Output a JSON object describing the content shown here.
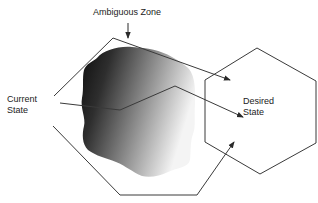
{
  "diagram": {
    "labels": {
      "ambiguous_zone": "Ambiguous Zone",
      "current_state_line1": "Current",
      "current_state_line2": "State",
      "desired_state_line1": "Desired",
      "desired_state_line2": "State"
    },
    "colors": {
      "stroke": "#3a3a3a",
      "blob_dark": "#0d0d0d",
      "blob_mid": "#6a6a6a",
      "blob_light": "#f4f4f4",
      "text": "#222222",
      "background": "#ffffff"
    },
    "shapes": {
      "desired_state": "hexagon",
      "ambiguous_zone": "irregular-blob",
      "current_state": "open-polygon-with-arrows"
    }
  }
}
